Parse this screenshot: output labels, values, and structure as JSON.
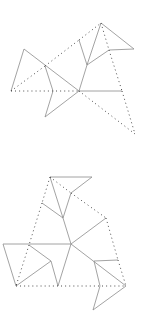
{
  "figures": [
    {
      "name": "top-net",
      "solid": [
        [
          24,
          49,
          11,
          91
        ],
        [
          24,
          49,
          79,
          91
        ],
        [
          45,
          66,
          53,
          91
        ],
        [
          53,
          91,
          45,
          117
        ],
        [
          45,
          117,
          79,
          91
        ],
        [
          79,
          40,
          87,
          65
        ],
        [
          79,
          91,
          87,
          65
        ],
        [
          79,
          91,
          122,
          91
        ],
        [
          87,
          65,
          101,
          23
        ],
        [
          87,
          65,
          109,
          50
        ],
        [
          101,
          23,
          134,
          49
        ],
        [
          109,
          50,
          134,
          49
        ]
      ],
      "dotted": [
        [
          11,
          91,
          79,
          91
        ],
        [
          11,
          91,
          45,
          66
        ],
        [
          45,
          66,
          79,
          40
        ],
        [
          79,
          40,
          101,
          23
        ],
        [
          101,
          23,
          109,
          50
        ],
        [
          109,
          50,
          122,
          91
        ],
        [
          79,
          91,
          135,
          134
        ],
        [
          122,
          91,
          135,
          134
        ]
      ]
    },
    {
      "name": "bottom-net",
      "solid": [
        [
          50,
          177,
          92,
          177
        ],
        [
          92,
          177,
          71,
          193
        ],
        [
          50,
          177,
          63,
          218
        ],
        [
          71,
          193,
          63,
          218
        ],
        [
          42,
          203,
          63,
          218
        ],
        [
          63,
          218,
          71,
          244
        ],
        [
          3,
          244,
          71,
          244
        ],
        [
          71,
          244,
          106,
          218
        ],
        [
          3,
          244,
          16,
          286
        ],
        [
          16,
          286,
          51,
          261
        ],
        [
          51,
          261,
          29,
          245
        ],
        [
          51,
          261,
          58,
          286
        ],
        [
          58,
          286,
          71,
          244
        ],
        [
          71,
          244,
          126,
          286
        ],
        [
          94,
          261,
          118,
          260
        ],
        [
          94,
          261,
          100,
          286
        ],
        [
          100,
          286,
          93,
          310
        ],
        [
          93,
          310,
          126,
          286
        ]
      ],
      "dotted": [
        [
          50,
          177,
          71,
          193
        ],
        [
          50,
          177,
          42,
          203
        ],
        [
          42,
          203,
          29,
          245
        ],
        [
          71,
          193,
          106,
          218
        ],
        [
          106,
          218,
          118,
          260
        ],
        [
          118,
          260,
          126,
          286
        ],
        [
          16,
          286,
          126,
          286
        ],
        [
          29,
          245,
          16,
          286
        ]
      ]
    }
  ]
}
